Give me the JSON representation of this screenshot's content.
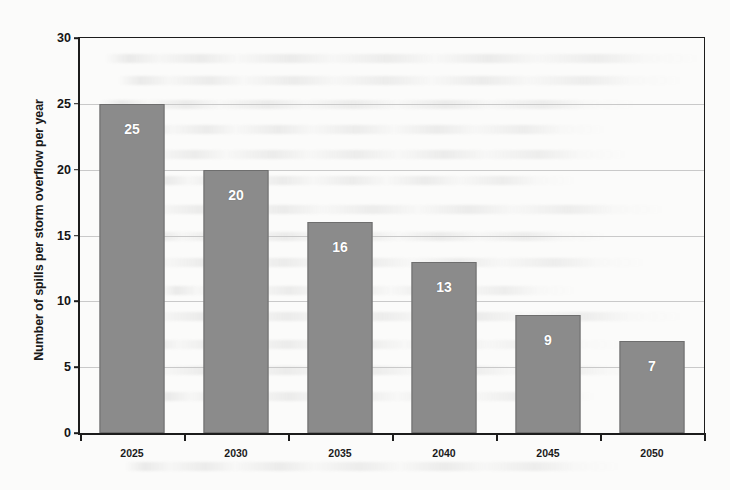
{
  "chart_data": {
    "type": "bar",
    "title": "",
    "subtitle": "",
    "xlabel": "",
    "ylabel": "Number of spills per storm overflow per year",
    "categories": [
      "2025",
      "2030",
      "2035",
      "2040",
      "2045",
      "2050"
    ],
    "values": [
      25,
      20,
      16,
      13,
      9,
      7
    ],
    "data_labels": [
      "25",
      "20",
      "16",
      "13",
      "9",
      "7"
    ],
    "ylim": [
      0,
      30
    ],
    "ytick_labels": [
      "0",
      "5",
      "10",
      "15",
      "20",
      "25",
      "30"
    ],
    "ytick_values": [
      0,
      5,
      10,
      15,
      20,
      25,
      30
    ],
    "grid": true,
    "grid_axis": "y",
    "legend": false,
    "legend_position": "none",
    "bar_color": "#8b8b8b",
    "bar_border_color": "#6e6e6e",
    "data_label_color": "#ffffff",
    "axis_color": "#1c1c1c",
    "gridline_color": "#c9c9c9",
    "background_color": "#fbfbfa"
  }
}
